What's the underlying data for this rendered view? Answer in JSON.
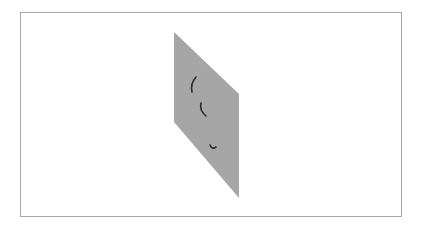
{
  "scene": {
    "background": "#ffffff",
    "frame": {
      "x": 20,
      "y": 12,
      "width": 382,
      "height": 205,
      "border_color": "#a8a8a8"
    },
    "panel": {
      "shape": "parallelogram",
      "fill": "#a6a6a6",
      "points": "174,32 239,94 239,198 174,122"
    },
    "marks": [
      {
        "name": "arc-upper",
        "path": "M196,77 Q190,84 192,92",
        "color": "#2a2a2a"
      },
      {
        "name": "arc-middle",
        "path": "M201,103 Q199,110 206,116",
        "color": "#2a2a2a"
      },
      {
        "name": "arc-lower",
        "path": "M210,145 Q212,150 216,147",
        "color": "#2a2a2a"
      }
    ]
  }
}
